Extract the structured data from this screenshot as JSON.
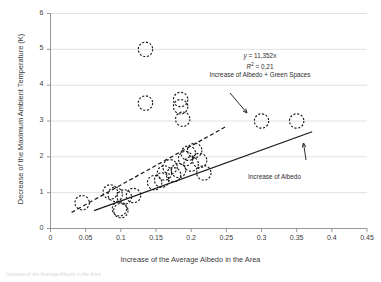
{
  "chart_data": {
    "type": "scatter",
    "title": "",
    "xlabel": "Increase of the Average Albedo in the Area",
    "ylabel": "Decrease of the Maximum Ambient Temperature (K)",
    "xlim": [
      0,
      0.45
    ],
    "ylim": [
      0,
      6
    ],
    "xticks": [
      "0",
      "0.05",
      "0.1",
      "0.15",
      "0.2",
      "0.25",
      "0.3",
      "0.35",
      "0.4",
      "0.45"
    ],
    "xtick_values": [
      0,
      0.05,
      0.1,
      0.15,
      0.2,
      0.25,
      0.3,
      0.35,
      0.4,
      0.45
    ],
    "yticks": [
      "0",
      "1",
      "2",
      "3",
      "4",
      "5",
      "6"
    ],
    "ytick_values": [
      0,
      1,
      2,
      3,
      4,
      5,
      6
    ],
    "grid": "horizontal",
    "legend": "none",
    "marker": "open-circle-dashed",
    "points": [
      {
        "x": 0.045,
        "y": 0.72
      },
      {
        "x": 0.085,
        "y": 1.02
      },
      {
        "x": 0.092,
        "y": 0.95
      },
      {
        "x": 0.098,
        "y": 0.55
      },
      {
        "x": 0.1,
        "y": 0.5
      },
      {
        "x": 0.105,
        "y": 0.88
      },
      {
        "x": 0.118,
        "y": 0.92
      },
      {
        "x": 0.135,
        "y": 5.0
      },
      {
        "x": 0.135,
        "y": 3.5
      },
      {
        "x": 0.148,
        "y": 1.28
      },
      {
        "x": 0.158,
        "y": 1.35
      },
      {
        "x": 0.162,
        "y": 1.55
      },
      {
        "x": 0.17,
        "y": 1.72
      },
      {
        "x": 0.175,
        "y": 1.5
      },
      {
        "x": 0.182,
        "y": 1.62
      },
      {
        "x": 0.185,
        "y": 3.6
      },
      {
        "x": 0.185,
        "y": 3.4
      },
      {
        "x": 0.188,
        "y": 3.05
      },
      {
        "x": 0.192,
        "y": 1.95
      },
      {
        "x": 0.196,
        "y": 2.1
      },
      {
        "x": 0.2,
        "y": 1.8
      },
      {
        "x": 0.205,
        "y": 2.18
      },
      {
        "x": 0.212,
        "y": 1.9
      },
      {
        "x": 0.218,
        "y": 1.55
      },
      {
        "x": 0.3,
        "y": 3.0
      },
      {
        "x": 0.35,
        "y": 3.0
      }
    ],
    "trendlines": [
      {
        "name": "Increase of Albedo + Green Spaces",
        "style": "dashed",
        "equation": "y = 11,352x",
        "r2": "R² = 0,21",
        "x_start": 0.03,
        "y_start": 0.45,
        "x_end": 0.25,
        "y_end": 2.85
      },
      {
        "name": "Increase of Albedo",
        "style": "solid",
        "x_start": 0.062,
        "y_start": 0.5,
        "x_end": 0.372,
        "y_end": 2.7
      }
    ],
    "annotations": [
      {
        "name": "equation-annotation",
        "lines": [
          "y = 11,352x",
          "R² = 0,21",
          "Increase of Albedo + Green Spaces"
        ]
      },
      {
        "name": "albedo-annotation",
        "lines": [
          "Increase of Albedo"
        ]
      }
    ]
  },
  "figure": {
    "eq_line1_prefix": "y",
    "eq_line1_rest": " = 11,352x",
    "eq_line2_prefix": "R",
    "eq_line2_sup": "2",
    "eq_line2_rest": " = 0,21",
    "eq_line3": "Increase of Albedo + Green Spaces",
    "label_albedo": "Increase of Albedo",
    "xaxis_title": "Increase of the Average Albedo in the Area",
    "yaxis_title": "Decrease of the Maximum Ambient Temperature (K)",
    "caption_cut": "Increase of the Average Albedo in the Area"
  }
}
